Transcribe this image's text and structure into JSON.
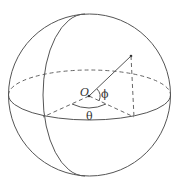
{
  "diagram": {
    "type": "sphere-spherical-coordinates",
    "labels": {
      "origin": "O",
      "polar_angle": "ϕ",
      "azimuth_angle": "θ"
    },
    "colors": {
      "stroke": "#555555",
      "text": "#333333",
      "background": "#ffffff"
    }
  }
}
